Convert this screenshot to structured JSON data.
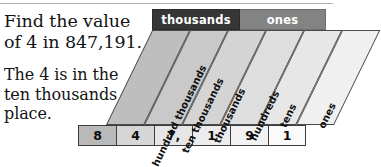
{
  "problem": {
    "question": "Find the value\nof 4 in 847,191.",
    "question_line1": "Find the value",
    "question_line2": "of 4 in 847,191.",
    "answer": "The 4 is in the\nten thousands\nplace.",
    "answer_line1": "The 4 is in the",
    "answer_line2": "ten thousands",
    "answer_line3": "place."
  },
  "chart": {
    "type": "place-value-chart",
    "number": "847,191",
    "period_headers": [
      {
        "label": "thousands",
        "color": "#363636",
        "text_color": "#ffffff",
        "spans_columns": 3
      },
      {
        "label": "ones",
        "color": "#838383",
        "text_color": "#ffffff",
        "spans_columns": 3
      }
    ],
    "columns": [
      {
        "label": "hundred thousands",
        "digit": "8",
        "fill": "#bebebe",
        "cell_fill": "#b9b9b9"
      },
      {
        "label": "ten thousands",
        "digit": "4",
        "fill": "#c9c9c9",
        "cell_fill": "#d6d6d6"
      },
      {
        "label": "thousands",
        "digit": "7,",
        "fill": "#d4d4d4",
        "cell_fill": "#e6e6e6"
      },
      {
        "label": "hundreds",
        "digit": "1",
        "fill": "#dedede",
        "cell_fill": "#ececec"
      },
      {
        "label": "tens",
        "digit": "9",
        "fill": "#e7e7e7",
        "cell_fill": "#f2f2f2"
      },
      {
        "label": "ones",
        "digit": "1",
        "fill": "#f0f0f0",
        "cell_fill": "#fafafa"
      }
    ]
  },
  "colors": {
    "page_background": "#ffffff",
    "text": "#131313",
    "rule": "#b4b4b4",
    "outline": "#4a4a4a"
  }
}
